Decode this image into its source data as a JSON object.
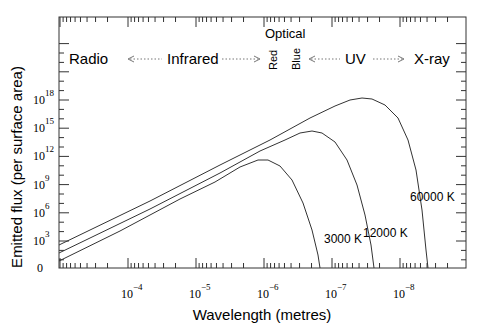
{
  "chart_data": {
    "type": "line",
    "title": "",
    "xlabel": "Wavelength (metres)",
    "ylabel": "Emitted flux (per surface area)",
    "x_scale": "log",
    "x_reversed": true,
    "x_ticks": [
      {
        "base": "10",
        "exp": "−4",
        "value": 0.0001
      },
      {
        "base": "10",
        "exp": "−5",
        "value": 1e-05
      },
      {
        "base": "10",
        "exp": "−6",
        "value": 1e-06
      },
      {
        "base": "10",
        "exp": "−7",
        "value": 1e-07
      },
      {
        "base": "10",
        "exp": "−8",
        "value": 1e-08
      }
    ],
    "y_scale": "log",
    "y_ticks": [
      {
        "base": "0",
        "exp": "",
        "value": 0
      },
      {
        "base": "10",
        "exp": "3",
        "value": 1000.0
      },
      {
        "base": "10",
        "exp": "6",
        "value": 1000000.0
      },
      {
        "base": "10",
        "exp": "9",
        "value": 1000000000.0
      },
      {
        "base": "10",
        "exp": "12",
        "value": 1000000000000.0
      },
      {
        "base": "10",
        "exp": "15",
        "value": 1000000000000000.0
      },
      {
        "base": "10",
        "exp": "18",
        "value": 1e+18
      }
    ],
    "series": [
      {
        "name": "60000 K",
        "label": "60000 K",
        "peak_wavelength_m": 5e-08,
        "peak_flux": 1e+18
      },
      {
        "name": "12000 K",
        "label": "12000 K",
        "peak_wavelength_m": 2.4e-07,
        "peak_flux": 3000000000000000.0
      },
      {
        "name": "3000 K",
        "label": "3000 K",
        "peak_wavelength_m": 1e-06,
        "peak_flux": 10000000000000.0
      }
    ],
    "bands": [
      {
        "label": "Radio"
      },
      {
        "label": "Infrared"
      },
      {
        "label": "Red",
        "group": "Optical"
      },
      {
        "label": "Blue",
        "group": "Optical"
      },
      {
        "label": "UV"
      },
      {
        "label": "X-ray"
      }
    ],
    "band_group_label": "Optical",
    "grid": false,
    "legend": "inline curve labels"
  }
}
